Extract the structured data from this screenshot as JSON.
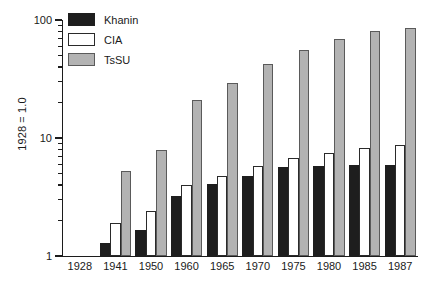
{
  "chart_data": {
    "type": "bar",
    "title": "",
    "subtitle": "",
    "xlabel": "",
    "ylabel": "1928 = 1.0",
    "yscale": "log",
    "ylim": [
      1,
      100
    ],
    "ytick_labels": [
      "100",
      "10",
      "1"
    ],
    "ytick_values": [
      100,
      10,
      1
    ],
    "grid": false,
    "legend_position": "top-left",
    "categories": [
      "1928",
      "1941",
      "1950",
      "1960",
      "1965",
      "1970",
      "1975",
      "1980",
      "1985",
      "1987"
    ],
    "series": [
      {
        "name": "Khanin",
        "color": "#1e1e1e",
        "values": [
          null,
          1.3,
          1.65,
          3.2,
          4.1,
          4.8,
          5.7,
          5.8,
          5.9,
          5.9
        ]
      },
      {
        "name": "CIA",
        "color": "#ffffff",
        "values": [
          null,
          1.9,
          2.4,
          4.0,
          4.8,
          5.8,
          6.8,
          7.4,
          8.3,
          8.8
        ]
      },
      {
        "name": "TsSU",
        "color": "#b3b3b3",
        "values": [
          null,
          5.3,
          7.9,
          21,
          29,
          42,
          56,
          69,
          80,
          85
        ]
      }
    ]
  },
  "legend": {
    "items": [
      {
        "label": "Khanin",
        "key": "khanin"
      },
      {
        "label": "CIA",
        "key": "cia"
      },
      {
        "label": "TsSU",
        "key": "tssu"
      }
    ]
  },
  "axes": {
    "y_title": "1928 = 1.0"
  }
}
